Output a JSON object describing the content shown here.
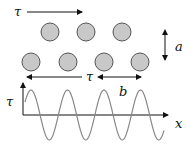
{
  "diagram": {
    "type": "atomic-lattice-shear-stress",
    "labels": {
      "shear_top": "τ",
      "shear_bottom": "τ",
      "row_spacing": "a",
      "atom_spacing": "b",
      "y_axis": "τ",
      "x_axis": "x"
    },
    "lattice": {
      "top_row_atoms": [
        {
          "cx": 50,
          "cy": 32
        },
        {
          "cx": 86,
          "cy": 32
        },
        {
          "cx": 122,
          "cy": 32
        }
      ],
      "bottom_row_atoms": [
        {
          "cx": 31,
          "cy": 62
        },
        {
          "cx": 68,
          "cy": 62
        },
        {
          "cx": 104,
          "cy": 62
        },
        {
          "cx": 140,
          "cy": 62
        }
      ],
      "atom_radius": 9,
      "atom_fill": "#c8c8c8",
      "atom_stroke": "#555555"
    },
    "plot": {
      "description": "Shear stress varies sinusoidally with displacement x, period b",
      "origin": {
        "x": 23,
        "y": 115
      },
      "amplitude_px": 25,
      "period_px": 36.5,
      "x_start": 25,
      "x_end": 164,
      "curve_color": "#888888",
      "axis_color": "#111111"
    }
  }
}
